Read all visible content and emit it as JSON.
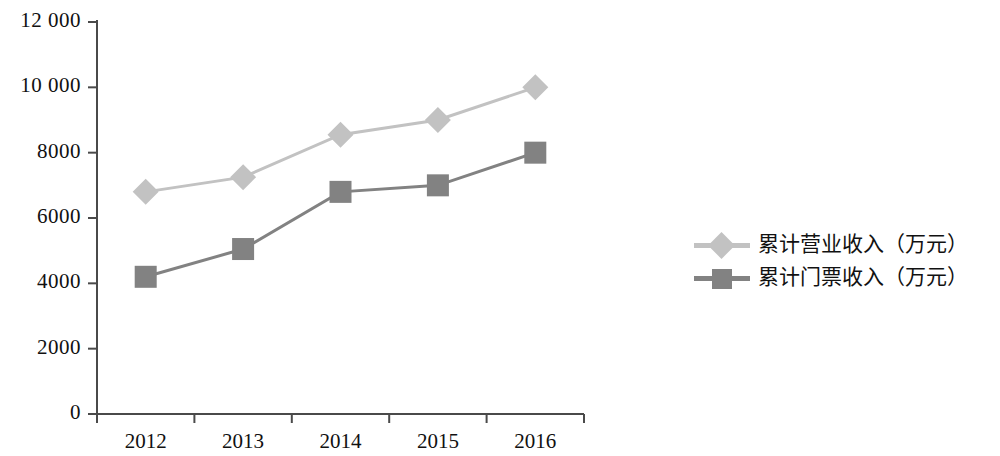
{
  "chart_data": {
    "type": "line",
    "title": "",
    "xlabel": "",
    "ylabel": "",
    "categories": [
      "2012",
      "2013",
      "2014",
      "2015",
      "2016"
    ],
    "series": [
      {
        "name": "累计营业收入（万元）",
        "values": [
          6800,
          7250,
          8550,
          9000,
          10000
        ],
        "color": "#c2c2c2",
        "marker": "diamond"
      },
      {
        "name": "累计门票收入（万元）",
        "values": [
          4200,
          5050,
          6800,
          7000,
          8000
        ],
        "color": "#828282",
        "marker": "square"
      }
    ],
    "ylim": [
      0,
      12000
    ],
    "yticks": [
      0,
      2000,
      4000,
      6000,
      8000,
      10000,
      12000
    ],
    "ytick_labels": [
      "0",
      "2000",
      "4000",
      "6000",
      "8000",
      "10 000",
      "12 000"
    ],
    "grid": false,
    "legend_position": "right"
  },
  "axis": {
    "y_labels": [
      "12 000",
      "10 000",
      "8000",
      "6000",
      "4000",
      "2000",
      "0"
    ],
    "x_labels": [
      "2012",
      "2013",
      "2014",
      "2015",
      "2016"
    ]
  },
  "legend": {
    "items": [
      {
        "label": "累计营业收入（万元）"
      },
      {
        "label": "累计门票收入（万元）"
      }
    ]
  }
}
